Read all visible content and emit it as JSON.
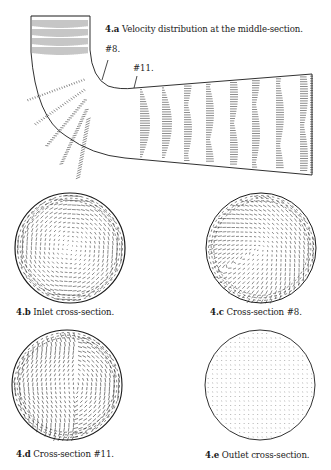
{
  "figure": {
    "panels": [
      {
        "id": "4.a",
        "num": "4.a",
        "title": "Velocity distribution at the middle-section."
      },
      {
        "id": "4.b",
        "num": "4.b",
        "title": "Inlet cross-section."
      },
      {
        "id": "4.c",
        "num": "4.c",
        "title": "Cross-section #8."
      },
      {
        "id": "4.d",
        "num": "4.d",
        "title": "Cross-section #11."
      },
      {
        "id": "4.e",
        "num": "4.e",
        "title": "Outlet cross-section."
      }
    ],
    "markers": {
      "section8": "#8.",
      "section11": "#11."
    }
  },
  "colors": {
    "ink": "#1a1a1a",
    "background": "#ffffff"
  }
}
